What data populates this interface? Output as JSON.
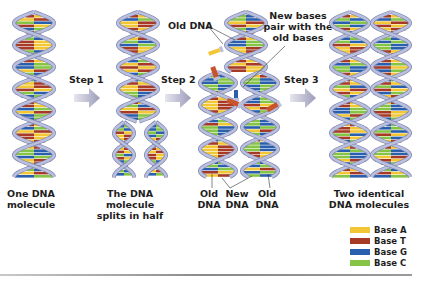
{
  "diagram": {
    "steps": [
      {
        "label": "Step 1"
      },
      {
        "label": "Step 2"
      },
      {
        "label": "Step 3"
      }
    ],
    "captions": {
      "one_molecule": [
        "One DNA",
        "molecule"
      ],
      "splits": [
        "The DNA molecule",
        "splits in half"
      ],
      "old_left": [
        "Old",
        "DNA"
      ],
      "new": [
        "New",
        "DNA"
      ],
      "old_right": [
        "Old",
        "DNA"
      ],
      "two_identical": [
        "Two identical",
        "DNA molecules"
      ]
    },
    "annotations": {
      "old_dna": "Old DNA",
      "new_bases": [
        "New bases",
        "pair with the",
        "old bases"
      ]
    },
    "legend": [
      {
        "label": "Base A",
        "color": "#f2c735"
      },
      {
        "label": "Base T",
        "color": "#a63a26"
      },
      {
        "label": "Base G",
        "color": "#2a5fae"
      },
      {
        "label": "Base C",
        "color": "#86c446"
      }
    ],
    "colors": {
      "backbone": "#b9bfdc",
      "backbone_edge": "#7c84b0",
      "arrow": "#a9a9c4"
    }
  }
}
